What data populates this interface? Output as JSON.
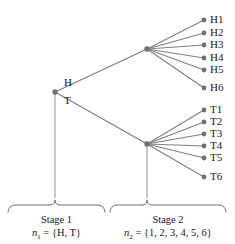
{
  "diagram": {
    "type": "probability-tree",
    "title_visible": false,
    "colors": {
      "line": "#808080",
      "node": "#707070",
      "text": "#1a1a1a",
      "background": "#ffffff"
    },
    "root": {
      "name": "root-node",
      "x": 55,
      "y": 92
    },
    "branch_labels": [
      {
        "text": "H",
        "x": 66,
        "y": 83
      },
      {
        "text": "T",
        "x": 66,
        "y": 101
      }
    ],
    "internal_nodes": [
      {
        "name": "heads-node",
        "label": "H",
        "x": 147,
        "y": 49
      },
      {
        "name": "tails-node",
        "label": "T",
        "x": 147,
        "y": 144
      }
    ],
    "leaves": [
      {
        "label": "H1",
        "x": 204,
        "y": 20,
        "parent": "heads-node"
      },
      {
        "label": "H2",
        "x": 204,
        "y": 33,
        "parent": "heads-node"
      },
      {
        "label": "H3",
        "x": 204,
        "y": 45,
        "parent": "heads-node"
      },
      {
        "label": "H4",
        "x": 204,
        "y": 58,
        "parent": "heads-node"
      },
      {
        "label": "H5",
        "x": 204,
        "y": 70,
        "parent": "heads-node"
      },
      {
        "label": "H6",
        "x": 204,
        "y": 88,
        "parent": "heads-node"
      },
      {
        "label": "T1",
        "x": 204,
        "y": 110,
        "parent": "tails-node"
      },
      {
        "label": "T2",
        "x": 204,
        "y": 122,
        "parent": "tails-node"
      },
      {
        "label": "T3",
        "x": 204,
        "y": 134,
        "parent": "tails-node"
      },
      {
        "label": "T4",
        "x": 204,
        "y": 146,
        "parent": "tails-node"
      },
      {
        "label": "T5",
        "x": 204,
        "y": 158,
        "parent": "tails-node"
      },
      {
        "label": "T6",
        "x": 204,
        "y": 177,
        "parent": "tails-node"
      }
    ],
    "stages": [
      {
        "name": "stage-1",
        "title": "Stage 1",
        "symbol": "n",
        "subscript": "1",
        "equals": "=",
        "set": "{H, T}",
        "brace": {
          "left": 8,
          "right": 105,
          "tick_x": 55,
          "top": 205
        },
        "stem": {
          "x": 55,
          "y_top": 92,
          "y_bottom": 198
        }
      },
      {
        "name": "stage-2",
        "title": "Stage 2",
        "symbol": "n",
        "subscript": "2",
        "equals": "=",
        "set": "{1, 2, 3, 4, 5, 6}",
        "brace": {
          "left": 110,
          "right": 226,
          "tick_x": 147,
          "top": 205
        },
        "stem": {
          "x": 147,
          "y_top": 144,
          "y_bottom": 198
        }
      }
    ]
  }
}
